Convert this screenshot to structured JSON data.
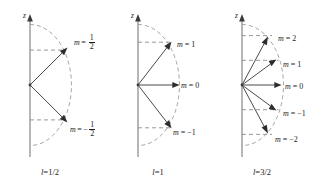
{
  "figure": {
    "axis_label": "z",
    "colors": {
      "axis": "#6e6e6e",
      "arc": "#9a9a9a",
      "level": "#8d8d8d",
      "vector": "#4a4a4a",
      "text": "#1d1d1d",
      "background": "#ffffff"
    }
  },
  "panels": [
    {
      "id": "panel-l-half",
      "caption_symbol": "l",
      "caption_eq": "=",
      "caption_value": "1/2",
      "caption_text": "l = 1/2",
      "axis_label": "z",
      "vector_count": 2,
      "states": [
        {
          "m_symbol": "m",
          "m_eq": "=",
          "m_value": "1/2",
          "label": "m = 1/2",
          "fraction": {
            "sign": "",
            "numerator": "1",
            "denominator": "2"
          },
          "cos_theta": 0.5774,
          "angle_deg": 54.7
        },
        {
          "m_symbol": "m",
          "m_eq": "=",
          "m_value": "-1/2",
          "label": "m = -1/2",
          "fraction": {
            "sign": "−",
            "numerator": "1",
            "denominator": "2"
          },
          "cos_theta": -0.5774,
          "angle_deg": 125.3
        }
      ]
    },
    {
      "id": "panel-l-one",
      "caption_symbol": "l",
      "caption_eq": "=",
      "caption_value": "1",
      "caption_text": "l = 1",
      "axis_label": "z",
      "vector_count": 3,
      "states": [
        {
          "m_symbol": "m",
          "m_eq": "=",
          "m_value": "1",
          "label": "m = 1",
          "cos_theta": 0.7071,
          "angle_deg": 45.0
        },
        {
          "m_symbol": "m",
          "m_eq": "=",
          "m_value": "0",
          "label": "m = 0",
          "cos_theta": 0.0,
          "angle_deg": 90.0
        },
        {
          "m_symbol": "m",
          "m_eq": "=",
          "m_value": "−1",
          "label": "m = -1",
          "cos_theta": -0.7071,
          "angle_deg": 135.0
        }
      ]
    },
    {
      "id": "panel-l-three-halves",
      "caption_symbol": "l",
      "caption_eq": "=",
      "caption_value": "3/2",
      "caption_text": "l = 3/2",
      "axis_label": "z",
      "vector_count": 5,
      "states": [
        {
          "m_symbol": "m",
          "m_eq": "=",
          "m_value": "2",
          "label": "m = 2",
          "cos_theta": 0.8165,
          "angle_deg": 35.3
        },
        {
          "m_symbol": "m",
          "m_eq": "=",
          "m_value": "1",
          "label": "m = 1",
          "cos_theta": 0.4082,
          "angle_deg": 65.9
        },
        {
          "m_symbol": "m",
          "m_eq": "=",
          "m_value": "0",
          "label": "m = 0",
          "cos_theta": 0.0,
          "angle_deg": 90.0
        },
        {
          "m_symbol": "m",
          "m_eq": "=",
          "m_value": "−1",
          "label": "m = -1",
          "cos_theta": -0.4082,
          "angle_deg": 114.1
        },
        {
          "m_symbol": "m",
          "m_eq": "=",
          "m_value": "−2",
          "label": "m = -2",
          "cos_theta": -0.8165,
          "angle_deg": 144.7
        }
      ]
    }
  ]
}
